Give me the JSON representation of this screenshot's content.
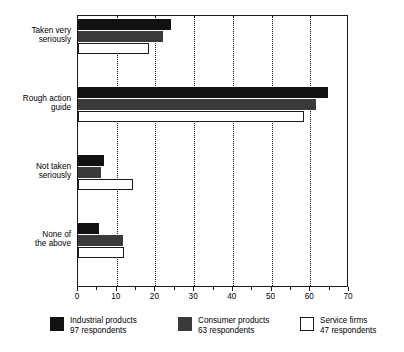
{
  "chart_data": {
    "type": "bar",
    "orientation": "horizontal",
    "title": "",
    "xlabel": "",
    "ylabel": "",
    "xlim": [
      0,
      70
    ],
    "ylim": null,
    "grid": true,
    "grid_axis": "x",
    "grid_style": "dotted",
    "legend_position": "bottom",
    "categories": [
      "Taken very seriously",
      "Rough action guide",
      "Not taken seriously",
      "None of the above"
    ],
    "category_lines": [
      [
        "Taken very",
        "seriously"
      ],
      [
        "Rough action",
        "guide"
      ],
      [
        "Not taken",
        "seriously"
      ],
      [
        "None of",
        "the above"
      ]
    ],
    "xticks": [
      0,
      10,
      20,
      30,
      40,
      50,
      60,
      70
    ],
    "xticklabels": [
      "0",
      "10",
      "20",
      "30",
      "40",
      "50",
      "60",
      "70"
    ],
    "series": [
      {
        "name": "Industrial products",
        "respondents": "97 respondents",
        "color": "#111111",
        "values": [
          24,
          64.5,
          6.7,
          5.4
        ]
      },
      {
        "name": "Consumer products",
        "respondents": "63 respondents",
        "color": "#3a3a3a",
        "values": [
          22,
          61.5,
          5.9,
          11.6
        ]
      },
      {
        "name": "Service firms",
        "respondents": "47 respondents",
        "color": "#ffffff",
        "values": [
          18.3,
          58.4,
          14.2,
          11.8
        ]
      }
    ]
  },
  "legend": {
    "items": [
      {
        "label": "Industrial products",
        "sub": "97 respondents"
      },
      {
        "label": "Consumer products",
        "sub": "63 respondents"
      },
      {
        "label": "Service firms",
        "sub": "47 respondents"
      }
    ]
  },
  "axis": {
    "x_labels": [
      "0",
      "10",
      "20",
      "30",
      "40",
      "50",
      "60",
      "70"
    ]
  }
}
